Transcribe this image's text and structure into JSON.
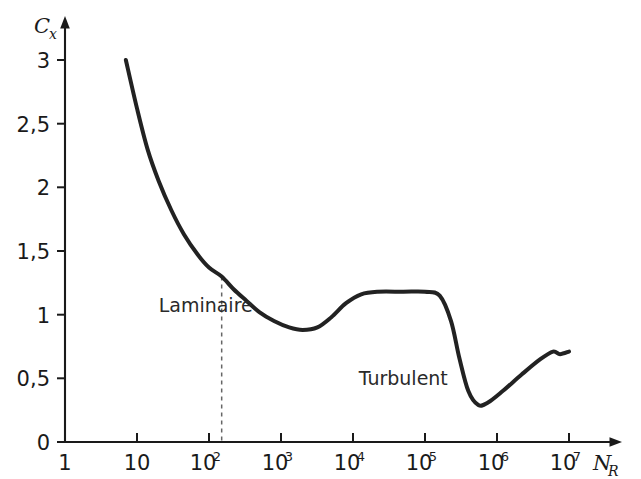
{
  "chart_data": {
    "type": "line",
    "title": "",
    "xlabel": "N_R",
    "ylabel": "C_x",
    "xlabel_base": "N",
    "xlabel_sub": "R",
    "ylabel_base": "C",
    "ylabel_sub": "x",
    "xscale": "log",
    "xlim": [
      1,
      10000000
    ],
    "ylim": [
      0,
      3
    ],
    "grid": false,
    "legend": null,
    "decimal_separator": ",",
    "x_ticks": [
      {
        "value": 1,
        "label": "1",
        "mantissa": "1",
        "exponent": ""
      },
      {
        "value": 10,
        "label": "10",
        "mantissa": "10",
        "exponent": ""
      },
      {
        "value": 100,
        "label": "10^2",
        "mantissa": "10",
        "exponent": "2"
      },
      {
        "value": 1000,
        "label": "10^3",
        "mantissa": "10",
        "exponent": "3"
      },
      {
        "value": 10000,
        "label": "10^4",
        "mantissa": "10",
        "exponent": "4"
      },
      {
        "value": 100000,
        "label": "10^5",
        "mantissa": "10",
        "exponent": "5"
      },
      {
        "value": 1000000,
        "label": "10^6",
        "mantissa": "10",
        "exponent": "6"
      },
      {
        "value": 10000000,
        "label": "10^7",
        "mantissa": "10",
        "exponent": "7"
      }
    ],
    "y_ticks": [
      {
        "value": 0,
        "label": "0"
      },
      {
        "value": 0.5,
        "label": "0,5"
      },
      {
        "value": 1,
        "label": "1"
      },
      {
        "value": 1.5,
        "label": "1,5"
      },
      {
        "value": 2,
        "label": "2"
      },
      {
        "value": 2.5,
        "label": "2,5"
      },
      {
        "value": 3,
        "label": "3"
      }
    ],
    "series": [
      {
        "name": "Cx",
        "points": [
          {
            "x": 7,
            "y": 3.0
          },
          {
            "x": 10,
            "y": 2.62
          },
          {
            "x": 14,
            "y": 2.3
          },
          {
            "x": 20,
            "y": 2.05
          },
          {
            "x": 30,
            "y": 1.82
          },
          {
            "x": 45,
            "y": 1.63
          },
          {
            "x": 70,
            "y": 1.47
          },
          {
            "x": 100,
            "y": 1.37
          },
          {
            "x": 150,
            "y": 1.3
          },
          {
            "x": 220,
            "y": 1.2
          },
          {
            "x": 330,
            "y": 1.11
          },
          {
            "x": 500,
            "y": 1.02
          },
          {
            "x": 800,
            "y": 0.95
          },
          {
            "x": 1300,
            "y": 0.9
          },
          {
            "x": 2000,
            "y": 0.88
          },
          {
            "x": 3200,
            "y": 0.9
          },
          {
            "x": 5000,
            "y": 0.98
          },
          {
            "x": 8000,
            "y": 1.09
          },
          {
            "x": 13000,
            "y": 1.16
          },
          {
            "x": 22000,
            "y": 1.18
          },
          {
            "x": 50000,
            "y": 1.18
          },
          {
            "x": 100000,
            "y": 1.18
          },
          {
            "x": 160000,
            "y": 1.15
          },
          {
            "x": 230000,
            "y": 0.95
          },
          {
            "x": 300000,
            "y": 0.66
          },
          {
            "x": 400000,
            "y": 0.4
          },
          {
            "x": 550000,
            "y": 0.29
          },
          {
            "x": 750000,
            "y": 0.31
          },
          {
            "x": 1200000,
            "y": 0.4
          },
          {
            "x": 2200000,
            "y": 0.53
          },
          {
            "x": 4000000,
            "y": 0.65
          },
          {
            "x": 6000000,
            "y": 0.71
          },
          {
            "x": 7500000,
            "y": 0.69
          },
          {
            "x": 10000000,
            "y": 0.71
          }
        ]
      }
    ],
    "annotations": [
      {
        "name": "laminar-region",
        "text": "Laminaire",
        "x_value": 20,
        "y_value": 1.02
      },
      {
        "name": "turbulent-region",
        "text": "Turbulent",
        "x_value": 12000,
        "y_value": 0.45
      }
    ],
    "separator": {
      "name": "transition-divider",
      "style": "dashed",
      "x_value": 150,
      "y_from": 0,
      "y_to": 1.3
    },
    "colors": {
      "curve": "#222222",
      "axis": "#1a1a1a",
      "background": "#ffffff",
      "dashed": "#666666",
      "text": "#1a1a1a"
    }
  }
}
